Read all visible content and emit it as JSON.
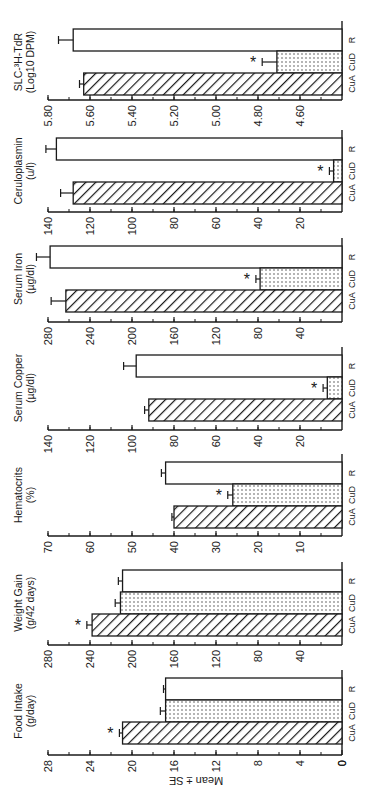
{
  "figure": {
    "ylabel": "Mean ± SE",
    "orientation": "rotated-90-ccw",
    "colors": {
      "ink": "#1a1a1a",
      "background": "#ffffff"
    },
    "groups": [
      "CuA",
      "CuD",
      "R"
    ],
    "group_patterns": {
      "CuA": "diagonal-hatch",
      "CuD": "dotted",
      "R": "open"
    },
    "significance_marker": "*"
  },
  "chart_data": [
    {
      "type": "bar",
      "title": "Food Intake",
      "unit_label": "(g/day)",
      "categories": [
        "CuA",
        "CuD",
        "R"
      ],
      "values": [
        20.9,
        16.8,
        16.8
      ],
      "errors": [
        0.3,
        0.5,
        0.2
      ],
      "significant": [
        true,
        false,
        false
      ],
      "ylabel": "Mean ± SE",
      "ylim": [
        0,
        28
      ],
      "ticks": [
        0,
        4,
        8,
        12,
        16,
        20,
        24,
        28
      ],
      "tick_labels": [
        "0",
        "4",
        "8",
        "12",
        "16",
        "20",
        "24",
        "28"
      ],
      "minor_step": 2
    },
    {
      "type": "bar",
      "title": "Weight Gain",
      "unit_label": "(g/42 days)",
      "categories": [
        "CuA",
        "CuD",
        "R"
      ],
      "values": [
        238,
        211,
        209
      ],
      "errors": [
        5,
        5,
        4
      ],
      "significant": [
        true,
        false,
        false
      ],
      "ylabel": "Mean ± SE",
      "ylim": [
        0,
        280
      ],
      "ticks": [
        40,
        80,
        120,
        160,
        200,
        240,
        280
      ],
      "tick_labels": [
        "40",
        "80",
        "120",
        "160",
        "200",
        "240",
        "280"
      ],
      "minor_step": 20
    },
    {
      "type": "bar",
      "title": "Hematocrits",
      "unit_label": "(%)",
      "categories": [
        "CuA",
        "CuD",
        "R"
      ],
      "values": [
        40,
        26,
        42
      ],
      "errors": [
        0.5,
        1.2,
        1.0
      ],
      "significant": [
        false,
        true,
        false
      ],
      "ylabel": "Mean ± SE",
      "ylim": [
        0,
        70
      ],
      "ticks": [
        10,
        20,
        30,
        40,
        50,
        60,
        70
      ],
      "tick_labels": [
        "10",
        "20",
        "30",
        "40",
        "50",
        "60",
        "70"
      ],
      "minor_step": 5
    },
    {
      "type": "bar",
      "title": "Serum Copper",
      "unit_label": "(µg/dl)",
      "categories": [
        "CuA",
        "CuD",
        "R"
      ],
      "values": [
        92,
        7,
        98
      ],
      "errors": [
        2,
        2,
        6
      ],
      "significant": [
        false,
        true,
        false
      ],
      "ylabel": "Mean ± SE",
      "ylim": [
        0,
        140
      ],
      "ticks": [
        20,
        40,
        60,
        80,
        100,
        120,
        140
      ],
      "tick_labels": [
        "20",
        "40",
        "60",
        "80",
        "100",
        "120",
        "140"
      ],
      "minor_step": 10
    },
    {
      "type": "bar",
      "title": "Serum Iron",
      "unit_label": "(µg/dl)",
      "categories": [
        "CuA",
        "CuD",
        "R"
      ],
      "values": [
        263,
        78,
        278
      ],
      "errors": [
        14,
        4,
        13
      ],
      "significant": [
        false,
        true,
        false
      ],
      "ylabel": "Mean ± SE",
      "ylim": [
        0,
        280
      ],
      "ticks": [
        40,
        80,
        120,
        160,
        200,
        240,
        280
      ],
      "tick_labels": [
        "40",
        "80",
        "120",
        "160",
        "200",
        "240",
        "280"
      ],
      "minor_step": 20
    },
    {
      "type": "bar",
      "title": "Ceruloplasmin",
      "unit_label": "(u/l)",
      "categories": [
        "CuA",
        "CuD",
        "R"
      ],
      "values": [
        128,
        4,
        136
      ],
      "errors": [
        6,
        2,
        5
      ],
      "significant": [
        false,
        true,
        false
      ],
      "ylabel": "Mean ± SE",
      "ylim": [
        0,
        140
      ],
      "ticks": [
        20,
        40,
        60,
        80,
        100,
        120,
        140
      ],
      "tick_labels": [
        "20",
        "40",
        "60",
        "80",
        "100",
        "120",
        "140"
      ],
      "minor_step": 10
    },
    {
      "type": "bar",
      "title": "SLC-³H-TdR",
      "unit_label": "(Log10 DPM)",
      "categories": [
        "CuA",
        "CuD",
        "R"
      ],
      "values": [
        5.63,
        4.71,
        5.68
      ],
      "errors": [
        0.02,
        0.07,
        0.07
      ],
      "significant": [
        false,
        true,
        false
      ],
      "ylabel": "Mean ± SE",
      "ylim": [
        4.4,
        5.8
      ],
      "ticks": [
        4.6,
        4.8,
        5.0,
        5.2,
        5.4,
        5.6,
        5.8
      ],
      "tick_labels": [
        "4.60",
        "4.80",
        "5.00",
        "5.20",
        "5.40",
        "5.60",
        "5.80"
      ],
      "minor_step": 0.1
    }
  ]
}
